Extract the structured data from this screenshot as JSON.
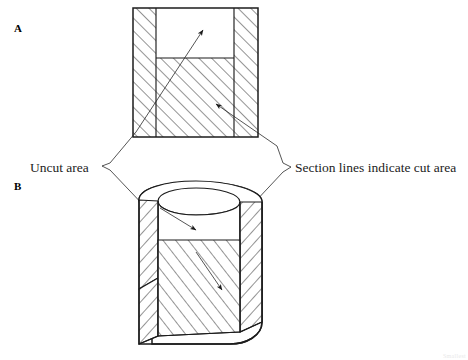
{
  "figure": {
    "title_a": "A",
    "title_b": "B",
    "callouts": [
      {
        "id": "uncut",
        "text": "Uncut area",
        "anchor_x": 30,
        "anchor_y": 168
      },
      {
        "id": "cut",
        "text": "Section lines indicate cut area",
        "anchor_x": 288,
        "anchor_y": 168
      }
    ],
    "corner_note": "Smallest",
    "colors": {
      "ink": "#1c1c1c",
      "paper": "#ffffff",
      "hatch": "#2a2a2a",
      "faint": "#e9e9e9"
    },
    "geometry": {
      "fig_a": {
        "outer_left": 133,
        "outer_top": 8,
        "outer_right": 258,
        "outer_bottom": 137,
        "cavity_left": 156,
        "cavity_top": 8,
        "cavity_right": 234,
        "cavity_bottom": 58,
        "description": "Rectangular full section view: hatched walls and floor, open uncut cavity at top center"
      },
      "fig_b": {
        "center_x": 196,
        "top_y": 186,
        "bottom_y": 347,
        "rim_rx": 66,
        "rim_ry": 22,
        "bore_rx": 44,
        "bore_ry": 15,
        "description": "Pictorial half-section of a cylindrical cup: near quadrant removed exposing hatched cut walls and floor plus uncut bore surface"
      }
    }
  }
}
